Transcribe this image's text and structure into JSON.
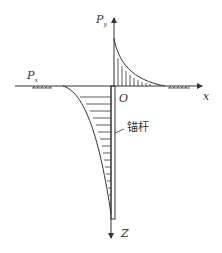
{
  "diagram": {
    "title": "",
    "labels": {
      "py_main": "P",
      "py_sub": "y",
      "px_main": "P",
      "px_sub": "x",
      "origin": "O",
      "x_axis": "x",
      "z_axis": "Z",
      "anchor_rod": "锚杆"
    },
    "colors": {
      "line": "#333333",
      "background": "#ffffff"
    }
  }
}
